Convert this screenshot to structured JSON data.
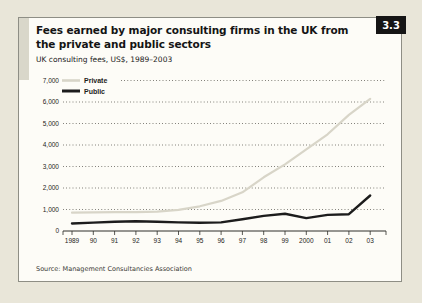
{
  "figure": {
    "badge": "3.3",
    "title_line1": "Fees earned by major consulting firms in the UK from",
    "title_line2": "the private and public sectors",
    "subtitle": "UK consulting fees, US$, 1989–2003",
    "source": "Source: Management Consultancies Association"
  },
  "colors": {
    "page_bg": "#e9e6d9",
    "panel_bg": "#fdfcf7",
    "badge_bg": "#151515",
    "badge_text": "#ffffff",
    "grid_dots": "#55544c",
    "axis": "#2f2f2a",
    "private_line": "#d8d5c8",
    "public_line": "#1c1c1c"
  },
  "chart_data": {
    "type": "line",
    "title": "Fees earned by major consulting firms in the UK from the private and public sectors",
    "subtitle": "UK consulting fees, US$, 1989–2003",
    "x": [
      "1989",
      "90",
      "91",
      "92",
      "93",
      "94",
      "95",
      "96",
      "97",
      "98",
      "99",
      "2000",
      "01",
      "02",
      "03"
    ],
    "series": [
      {
        "name": "Private",
        "color": "#d8d5c8",
        "values": [
          850,
          870,
          880,
          880,
          900,
          980,
          1150,
          1400,
          1800,
          2500,
          3100,
          3800,
          4500,
          5400,
          6150
        ]
      },
      {
        "name": "Public",
        "color": "#1c1c1c",
        "values": [
          350,
          390,
          430,
          450,
          430,
          400,
          380,
          400,
          550,
          700,
          800,
          600,
          750,
          780,
          1650
        ]
      }
    ],
    "ylim": [
      0,
      7000
    ],
    "ytick_step": 1000,
    "ytick_labels": [
      "0",
      "1,000",
      "2,000",
      "3,000",
      "4,000",
      "5,000",
      "6,000",
      "7,000"
    ],
    "grid": "dotted-horizontal",
    "legend_position": "top-left",
    "source": "Source: Management Consultancies Association"
  }
}
